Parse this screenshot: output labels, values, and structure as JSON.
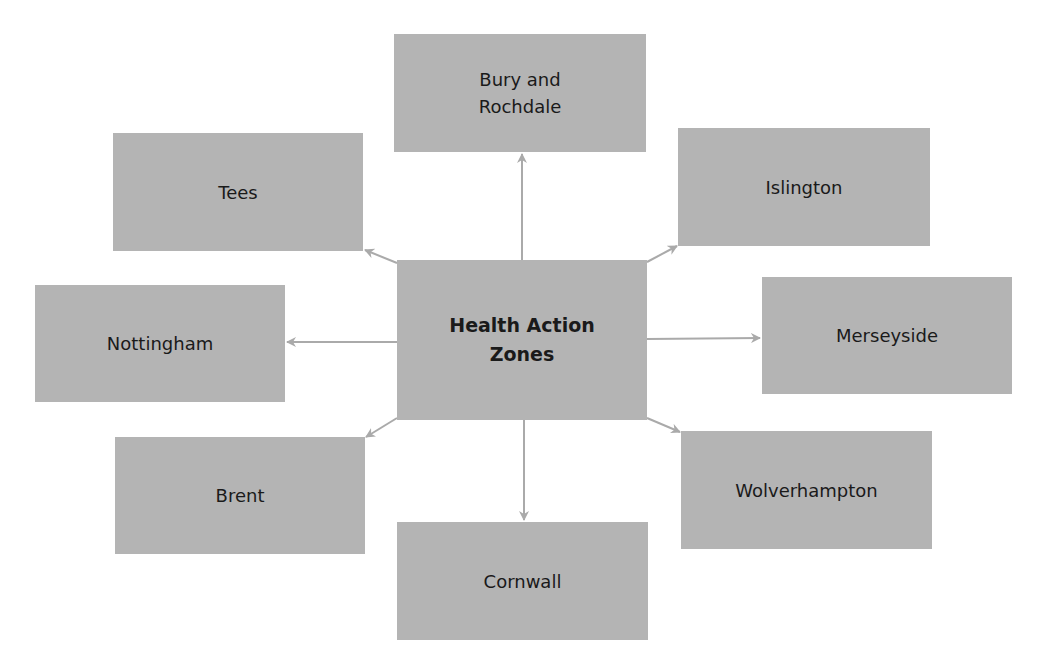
{
  "diagram": {
    "type": "hub-and-spoke",
    "colors": {
      "node_fill": "#b4b4b4",
      "arrow": "#aaaaaa",
      "text": "#1a1a1a",
      "background": "#ffffff"
    },
    "center": {
      "label": "Health Action\nZones"
    },
    "spokes": [
      {
        "id": "bury",
        "label": "Bury and\nRochdale",
        "direction": "up"
      },
      {
        "id": "islington",
        "label": "Islington",
        "direction": "up-right"
      },
      {
        "id": "merseyside",
        "label": "Merseyside",
        "direction": "right"
      },
      {
        "id": "wolverhampton",
        "label": "Wolverhampton",
        "direction": "down-right"
      },
      {
        "id": "cornwall",
        "label": "Cornwall",
        "direction": "down"
      },
      {
        "id": "brent",
        "label": "Brent",
        "direction": "down-left"
      },
      {
        "id": "nottingham",
        "label": "Nottingham",
        "direction": "left"
      },
      {
        "id": "tees",
        "label": "Tees",
        "direction": "up-left"
      }
    ]
  }
}
